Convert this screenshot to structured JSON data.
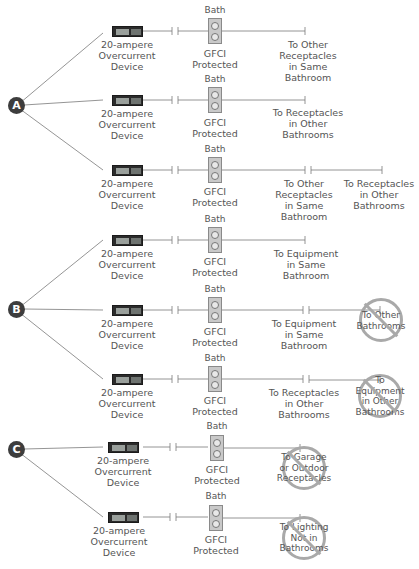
{
  "groups": [
    {
      "label": "A",
      "rows": [
        0,
        1,
        2
      ]
    },
    {
      "label": "B",
      "rows": [
        3,
        4,
        5
      ]
    },
    {
      "label": "C",
      "rows": [
        6,
        7
      ]
    }
  ],
  "device_label": [
    "20-ampere",
    "Overcurrent",
    "Device"
  ],
  "receptacle": {
    "top_label": "Bath",
    "bottom_label": [
      "GFCI",
      "Protected"
    ]
  },
  "rows": [
    {
      "y": 31,
      "dests": [
        {
          "text": [
            "To Other",
            "Receptacles",
            "in Same",
            "Bathroom"
          ],
          "prohibited": false
        }
      ]
    },
    {
      "y": 100,
      "dests": [
        {
          "text": [
            "To Receptacles",
            "in Other",
            "Bathrooms"
          ],
          "prohibited": false
        }
      ]
    },
    {
      "y": 170,
      "dests": [
        {
          "text": [
            "To Other",
            "Receptacles",
            "in Same",
            "Bathroom"
          ],
          "prohibited": false
        },
        {
          "text": [
            "To Receptacles",
            "in Other",
            "Bathrooms"
          ],
          "prohibited": false
        }
      ]
    },
    {
      "y": 240,
      "dests": [
        {
          "text": [
            "To Equipment",
            "in Same",
            "Bathroom"
          ],
          "prohibited": false
        }
      ]
    },
    {
      "y": 310,
      "dests": [
        {
          "text": [
            "To Equipment",
            "in Same",
            "Bathroom"
          ],
          "prohibited": false
        },
        {
          "text": [
            "To Other",
            "Bathrooms"
          ],
          "prohibited": true
        }
      ]
    },
    {
      "y": 380,
      "dests": [
        {
          "text": [
            "To Receptacles",
            "in Other",
            "Bathrooms"
          ],
          "prohibited": false
        },
        {
          "text": [
            "To Equipment",
            "in Other",
            "Bathrooms"
          ],
          "prohibited": true
        }
      ]
    },
    {
      "y": 448,
      "dests": [
        {
          "text": [
            "To Garage",
            "or Outdoor",
            "Receptacles"
          ],
          "prohibited": true
        }
      ]
    },
    {
      "y": 518,
      "dests": [
        {
          "text": [
            "To Lighting",
            "Not in",
            "Bathrooms"
          ],
          "prohibited": true
        }
      ]
    }
  ],
  "colors": {
    "line": "#7a7a7a",
    "badge": "#3d3d3d",
    "prohibited": "#a9a9a9",
    "receptacle": "#c9c9c9"
  }
}
